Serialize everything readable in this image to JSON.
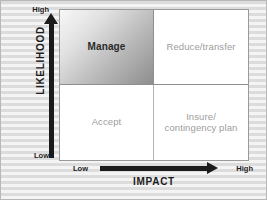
{
  "diagram": {
    "type": "risk-matrix",
    "y_axis": {
      "title": "LIKELIHOOD",
      "low_label": "Low",
      "high_label": "High",
      "arrow_direction": "up"
    },
    "x_axis": {
      "title": "IMPACT",
      "low_label": "Low",
      "high_label": "High",
      "arrow_direction": "right"
    },
    "quadrants": [
      {
        "id": "high-likelihood-low-impact",
        "label": "Manage",
        "position": "top-left",
        "emphasis": true,
        "fill": "gradient-gray"
      },
      {
        "id": "high-likelihood-high-impact",
        "label": "Reduce/transfer",
        "position": "top-right",
        "emphasis": false,
        "fill": "#ffffff"
      },
      {
        "id": "low-likelihood-low-impact",
        "label": "Accept",
        "position": "bottom-left",
        "emphasis": false,
        "fill": "#ffffff"
      },
      {
        "id": "low-likelihood-high-impact",
        "label_line1": "Insure/",
        "label_line2": "contingency plan",
        "position": "bottom-right",
        "emphasis": false,
        "fill": "#ffffff"
      }
    ],
    "colors": {
      "background": "#f2f2f2",
      "stripe": "#dcdcdc",
      "border": "#9a9a9a",
      "axis": "#1b1b1b",
      "quad_text": "#9d9d9d",
      "emph_text": "#2a2a2a"
    }
  }
}
